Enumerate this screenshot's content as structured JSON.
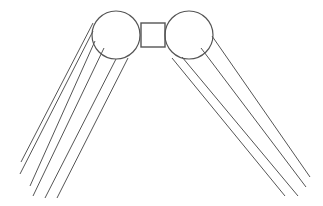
{
  "diagram": {
    "width": 323,
    "height": 206,
    "stroke_color": "#555555",
    "background": "#ffffff",
    "left_circle": {
      "cx": 116,
      "cy": 35,
      "r": 24
    },
    "right_circle": {
      "cx": 189,
      "cy": 35,
      "r": 24
    },
    "center_square": {
      "x": 141,
      "y": 23,
      "w": 24,
      "h": 24
    },
    "left_lines": [
      {
        "x1": 93,
        "y1": 23,
        "x2": 21,
        "y2": 162
      },
      {
        "x1": 93,
        "y1": 31,
        "x2": 20,
        "y2": 174
      },
      {
        "x1": 95,
        "y1": 41,
        "x2": 30,
        "y2": 186
      },
      {
        "x1": 104,
        "y1": 48,
        "x2": 33,
        "y2": 196
      },
      {
        "x1": 116,
        "y1": 59,
        "x2": 45,
        "y2": 198
      },
      {
        "x1": 128,
        "y1": 58,
        "x2": 57,
        "y2": 198
      }
    ],
    "right_lines": [
      {
        "x1": 172,
        "y1": 58,
        "x2": 285,
        "y2": 196
      },
      {
        "x1": 182,
        "y1": 57,
        "x2": 298,
        "y2": 196
      },
      {
        "x1": 201,
        "y1": 48,
        "x2": 306,
        "y2": 187
      },
      {
        "x1": 212,
        "y1": 36,
        "x2": 310,
        "y2": 177
      }
    ]
  }
}
